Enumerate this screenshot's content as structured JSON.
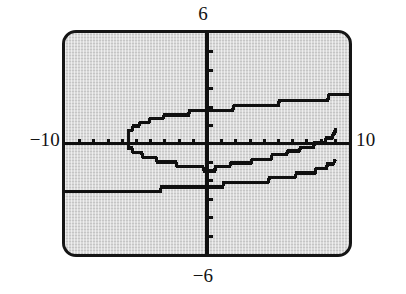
{
  "device": {
    "name": "graphing-calculator-screen",
    "screen_background": "#d9d9d9",
    "ink_color": "#101010",
    "bezel_color": "#151515"
  },
  "labels": {
    "ymax": "6",
    "ymin": "−6",
    "xmin": "−10",
    "xmax": "10"
  },
  "chart_data": {
    "type": "line",
    "title": "",
    "subtitle": "",
    "xlabel": "",
    "ylabel": "",
    "grid": false,
    "legend": null,
    "legend_position": "none",
    "xlim": [
      -10,
      10
    ],
    "ylim": [
      -6,
      6
    ],
    "xscl": 1,
    "yscl": 1,
    "xtick_labels": [
      "-10",
      "10"
    ],
    "ytick_labels": [
      "6",
      "-6"
    ],
    "axis_ticks_x": [
      -9,
      -8,
      -7,
      -6,
      -5,
      -4,
      -3,
      -2,
      -1,
      1,
      2,
      3,
      4,
      5,
      6,
      7,
      8,
      9
    ],
    "axis_ticks_y": [
      -5,
      -4,
      -3,
      -2,
      -1,
      1,
      2,
      3,
      4,
      5
    ],
    "pixelated": true,
    "annotations": [],
    "series": [
      {
        "name": "upper-branch",
        "points": [
          [
            10.0,
            2.65
          ],
          [
            8.6,
            2.65
          ],
          [
            8.5,
            2.35
          ],
          [
            5.1,
            2.35
          ],
          [
            5.0,
            2.05
          ],
          [
            1.9,
            2.05
          ],
          [
            1.8,
            1.8
          ],
          [
            -1.2,
            1.8
          ],
          [
            -1.3,
            1.55
          ],
          [
            -3.0,
            1.55
          ],
          [
            -3.1,
            1.35
          ],
          [
            -4.0,
            1.35
          ],
          [
            -4.1,
            1.15
          ],
          [
            -4.7,
            1.15
          ],
          [
            -4.8,
            0.95
          ],
          [
            -5.2,
            0.95
          ],
          [
            -5.3,
            0.7
          ],
          [
            -5.5,
            0.7
          ],
          [
            -5.55,
            0.35
          ],
          [
            -5.55,
            0.05
          ]
        ]
      },
      {
        "name": "lower-mid-branch",
        "points": [
          [
            -5.55,
            0.05
          ],
          [
            -5.5,
            -0.25
          ],
          [
            -5.3,
            -0.25
          ],
          [
            -5.2,
            -0.5
          ],
          [
            -4.6,
            -0.5
          ],
          [
            -4.5,
            -0.75
          ],
          [
            -3.6,
            -0.75
          ],
          [
            -3.5,
            -1.0
          ],
          [
            -2.2,
            -1.0
          ],
          [
            -2.1,
            -1.25
          ],
          [
            -0.3,
            -1.25
          ],
          [
            -0.2,
            -1.5
          ],
          [
            0.55,
            -1.5
          ],
          [
            0.6,
            -1.25
          ],
          [
            1.6,
            -1.25
          ],
          [
            1.7,
            -1.05
          ],
          [
            3.1,
            -1.05
          ],
          [
            3.2,
            -0.85
          ],
          [
            4.5,
            -0.85
          ],
          [
            4.6,
            -0.6
          ],
          [
            5.6,
            -0.6
          ],
          [
            5.7,
            -0.4
          ],
          [
            6.5,
            -0.4
          ],
          [
            6.6,
            -0.2
          ],
          [
            7.5,
            -0.2
          ],
          [
            7.6,
            0.05
          ],
          [
            8.3,
            0.05
          ],
          [
            8.4,
            0.3
          ],
          [
            8.8,
            0.3
          ],
          [
            8.9,
            0.55
          ],
          [
            9.0,
            0.55
          ],
          [
            9.05,
            0.85
          ]
        ]
      },
      {
        "name": "lower-branch",
        "points": [
          [
            9.05,
            0.85
          ],
          [
            8.9,
            1.1
          ],
          [
            8.5,
            1.1
          ],
          [
            8.4,
            1.35
          ],
          [
            7.7,
            1.35
          ],
          [
            7.6,
            1.6
          ],
          [
            6.3,
            1.6
          ],
          [
            6.2,
            1.85
          ],
          [
            4.4,
            1.85
          ],
          [
            4.3,
            2.1
          ],
          [
            1.2,
            2.1
          ],
          [
            1.1,
            2.35
          ],
          [
            -3.2,
            2.35
          ],
          [
            -3.3,
            2.6
          ],
          [
            -10.0,
            2.6
          ]
        ],
        "note": "y values listed positive are plotted mirrored below the x-axis"
      }
    ]
  }
}
